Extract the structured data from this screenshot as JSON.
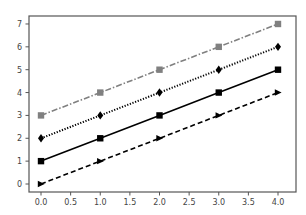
{
  "chart_data": {
    "type": "line",
    "title": "",
    "xlabel": "",
    "ylabel": "",
    "x": [
      0.0,
      1.0,
      2.0,
      3.0,
      4.0
    ],
    "xlim": [
      -0.13,
      4.15
    ],
    "ylim": [
      -0.35,
      7.35
    ],
    "grid": false,
    "legend": null,
    "x_ticks": [
      "0.0",
      "0.5",
      "1.0",
      "1.5",
      "2.0",
      "2.5",
      "3.0",
      "3.5",
      "4.0"
    ],
    "y_ticks": [
      "0",
      "1",
      "2",
      "3",
      "4",
      "5",
      "6",
      "7"
    ],
    "series": [
      {
        "name": "y = x + 3",
        "values": [
          3,
          4,
          5,
          6,
          7
        ],
        "color": "#808080",
        "linestyle": "dashdot",
        "marker": "square"
      },
      {
        "name": "y = x + 2",
        "values": [
          2,
          3,
          4,
          5,
          6
        ],
        "color": "#000000",
        "linestyle": "dotted",
        "marker": "diamond"
      },
      {
        "name": "y = x + 1",
        "values": [
          1,
          2,
          3,
          4,
          5
        ],
        "color": "#000000",
        "linestyle": "solid",
        "marker": "square"
      },
      {
        "name": "y = x",
        "values": [
          0,
          1,
          2,
          3,
          4
        ],
        "color": "#000000",
        "linestyle": "dashed",
        "marker": "triangle-right"
      }
    ]
  }
}
